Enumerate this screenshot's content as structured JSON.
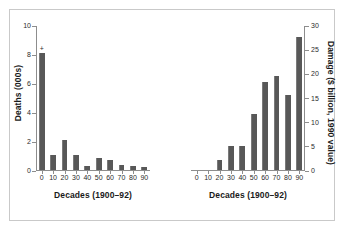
{
  "chart_data": [
    {
      "type": "bar",
      "title": "",
      "panel": "left",
      "xlabel": "Decades (1900–92)",
      "ylabel": "Deaths (000s)",
      "categories": [
        "0",
        "10",
        "20",
        "30",
        "40",
        "50",
        "60",
        "70",
        "80",
        "90"
      ],
      "values": [
        8.1,
        1.05,
        2.05,
        1.05,
        0.3,
        0.85,
        0.7,
        0.35,
        0.3,
        0.2
      ],
      "ylim": [
        0,
        10
      ],
      "yticks": [
        "0",
        "2",
        "4",
        "6",
        "8",
        "10"
      ],
      "ytick_values": [
        0,
        2,
        4,
        6,
        8,
        10
      ],
      "annotations": [
        {
          "category": "0",
          "text": "+"
        }
      ],
      "grid": false,
      "legend": "none",
      "bar_color": "#585858"
    },
    {
      "type": "bar",
      "title": "",
      "panel": "right",
      "xlabel": "Decades (1900–92)",
      "ylabel": "Damage ($ billion, 1990 value)",
      "categories": [
        "0",
        "10",
        "20",
        "30",
        "40",
        "50",
        "60",
        "70",
        "80",
        "90"
      ],
      "values": [
        0,
        0,
        2.0,
        5.0,
        5.0,
        11.5,
        18.3,
        19.5,
        15.5,
        27.5
      ],
      "ylim": [
        0,
        30
      ],
      "yticks": [
        "0",
        "5",
        "10",
        "15",
        "20",
        "25",
        "30"
      ],
      "ytick_values": [
        0,
        5,
        10,
        15,
        20,
        25,
        30
      ],
      "annotations": [],
      "grid": false,
      "legend": "none",
      "bar_color": "#585858"
    }
  ],
  "left_axis": {
    "title": "Deaths (000s)",
    "xtitle": "Decades (1900–92)"
  },
  "right_axis": {
    "title": "Damage ($ billion, 1990 value)",
    "xtitle": "Decades (1900–92)"
  }
}
